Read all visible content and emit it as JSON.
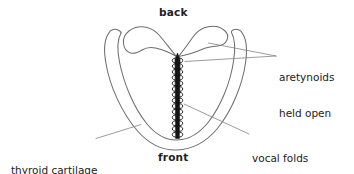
{
  "diagram": {
    "orientation_labels": {
      "back": "back",
      "front": "front"
    },
    "annotations": [
      {
        "id": "thyroid-cartilage",
        "text": "thyroid cartilage",
        "lines": [
          "thyroid cartilage"
        ]
      },
      {
        "id": "arytenoids",
        "text": "aretynoids held open",
        "lines": [
          "aretynoids",
          "held open"
        ]
      },
      {
        "id": "vocal-folds",
        "text": "vocal folds vibrating",
        "lines": [
          "vocal folds",
          "vibrating"
        ]
      }
    ],
    "parts": {
      "thyroid_cartilage": "thyroid cartilage",
      "arytenoid_left": "left arytenoid cartilage",
      "arytenoid_right": "right arytenoid cartilage",
      "vocal_folds": "vocal folds vibrating"
    },
    "colors": {
      "background": "#ffffff",
      "outline": "#6e6e6e",
      "vocal_fold_line": "#141414",
      "coil": "#1a1a1a",
      "leader_line": "#8a8a8a",
      "text": "#222222"
    },
    "vocal_fold_coil": {
      "ring_count": 15,
      "top_y": 57,
      "bottom_y": 139
    }
  }
}
